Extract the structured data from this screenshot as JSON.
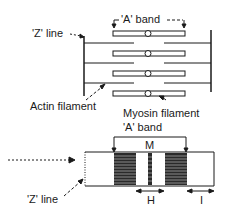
{
  "diagram": {
    "top": {
      "a_band_label": "'A' band",
      "z_line_label": "'Z' line",
      "actin_label": "Actin filament",
      "myosin_label": "Myosin filament"
    },
    "bottom": {
      "a_band_label": "'A' band",
      "m_label": "M",
      "z_line_label": "'Z' line",
      "h_label": "H",
      "i_label": "I"
    },
    "colors": {
      "ink": "#1a1a1a",
      "background": "#ffffff"
    }
  }
}
